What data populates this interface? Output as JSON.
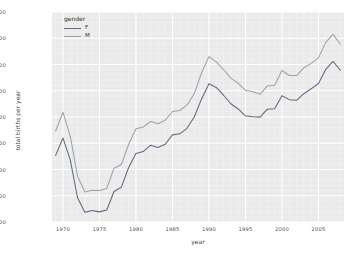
{
  "chart_data": {
    "type": "line",
    "title": "",
    "xlabel": "year",
    "ylabel": "total births per year",
    "xlim": [
      1968.5,
      2008.5
    ],
    "ylim": [
      1500000,
      2300000
    ],
    "grid": true,
    "legend": {
      "title": "gender",
      "position": "upper left",
      "entries": [
        {
          "name": "F",
          "color": "#5c6b80"
        },
        {
          "name": "M",
          "color": "#9aa3ad"
        }
      ]
    },
    "xticks": [
      1970,
      1975,
      1980,
      1985,
      1990,
      1995,
      2000,
      2005
    ],
    "xtick_labels": [
      "1970",
      "1975",
      "1980",
      "1985",
      "1990",
      "1995",
      "2000",
      "2005"
    ],
    "yticks": [
      1500000,
      1600000,
      1700000,
      1800000,
      1900000,
      2000000,
      2100000,
      2200000,
      2300000
    ],
    "ytick_labels": [
      "1500000",
      "1600000",
      "1700000",
      "1800000",
      "1900000",
      "2000000",
      "2100000",
      "2200000",
      "2300000"
    ],
    "x": [
      1969,
      1970,
      1971,
      1972,
      1973,
      1974,
      1975,
      1976,
      1977,
      1978,
      1979,
      1980,
      1981,
      1982,
      1983,
      1984,
      1985,
      1986,
      1987,
      1988,
      1989,
      1990,
      1991,
      1992,
      1993,
      1994,
      1995,
      1996,
      1997,
      1998,
      1999,
      2000,
      2001,
      2002,
      2003,
      2004,
      2005,
      2006,
      2007,
      2008
    ],
    "series": [
      {
        "name": "F",
        "color": "#5c6b80",
        "values": [
          1753634,
          1820178,
          1736774,
          1592347,
          1537119,
          1543920,
          1538576,
          1545917,
          1616087,
          1632594,
          1707805,
          1760832,
          1768161,
          1792556,
          1784151,
          1796353,
          1831951,
          1835874,
          1856917,
          1900766,
          1969920,
          2026853,
          2012512,
          1982917,
          1950466,
          1930546,
          1904556,
          1901014,
          1899572,
          1929876,
          1931762,
          1980946,
          1966049,
          1963747,
          1988810,
          2007391,
          2027501,
          2081330,
          2111890,
          2077929
        ]
      },
      {
        "name": "M",
        "color": "#9aa3ad",
        "values": [
          1846572,
          1918297,
          1826974,
          1674420,
          1614550,
          1621101,
          1620377,
          1627805,
          1704990,
          1718843,
          1796326,
          1855103,
          1861900,
          1882982,
          1874290,
          1887557,
          1920767,
          1924868,
          1945918,
          1989175,
          2069490,
          2129495,
          2110036,
          2080886,
          2048274,
          2028502,
          2001790,
          1996355,
          1986404,
          2018418,
          2020821,
          2076969,
          2057922,
          2057979,
          2087497,
          2104457,
          2125279,
          2184237,
          2214930,
          2177227
        ]
      }
    ]
  }
}
